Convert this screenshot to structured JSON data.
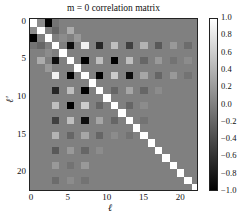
{
  "chart_data": {
    "type": "heatmap",
    "title": "m = 0 correlation matrix",
    "xlabel": "ℓ",
    "ylabel": "ℓ'",
    "size": 23,
    "x_ticks": [
      0,
      5,
      10,
      15,
      20
    ],
    "y_ticks": [
      0,
      5,
      10,
      15,
      20
    ],
    "colorbar": {
      "min": -1.0,
      "max": 1.0,
      "ticks": [
        "1.0",
        "0.8",
        "0.6",
        "0.4",
        "0.2",
        "0.0",
        "−0.2",
        "−0.4",
        "−0.6",
        "−0.8",
        "−1.0"
      ],
      "colormap": "gray"
    },
    "diagonal": 1.0,
    "offdiag_entries": [
      [
        0,
        1,
        0.1
      ],
      [
        0,
        2,
        -1.0
      ],
      [
        0,
        3,
        -0.1
      ],
      [
        1,
        3,
        -0.2
      ],
      [
        1,
        5,
        0.35
      ],
      [
        2,
        4,
        0.1
      ],
      [
        2,
        6,
        0.2
      ],
      [
        3,
        5,
        -0.9
      ],
      [
        3,
        7,
        0.9
      ],
      [
        3,
        9,
        -0.7
      ],
      [
        3,
        11,
        0.5
      ],
      [
        3,
        13,
        -0.5
      ],
      [
        3,
        15,
        0.4
      ],
      [
        3,
        17,
        -0.3
      ],
      [
        3,
        19,
        0.2
      ],
      [
        3,
        21,
        -0.15
      ],
      [
        5,
        7,
        -1.0
      ],
      [
        5,
        9,
        0.5
      ],
      [
        5,
        11,
        -1.0
      ],
      [
        5,
        13,
        0.5
      ],
      [
        5,
        15,
        -0.2
      ],
      [
        5,
        17,
        0.2
      ],
      [
        5,
        19,
        -0.1
      ],
      [
        5,
        21,
        0.1
      ],
      [
        7,
        9,
        -1.0
      ],
      [
        7,
        11,
        0.6
      ],
      [
        7,
        13,
        -0.9
      ],
      [
        7,
        15,
        0.3
      ],
      [
        7,
        17,
        -0.2
      ],
      [
        7,
        19,
        0.2
      ],
      [
        7,
        21,
        -0.1
      ],
      [
        9,
        11,
        -0.2
      ],
      [
        9,
        13,
        0.3
      ],
      [
        9,
        15,
        -0.2
      ],
      [
        9,
        17,
        0.1
      ],
      [
        11,
        13,
        -0.2
      ],
      [
        11,
        15,
        0.1
      ],
      [
        13,
        15,
        -0.1
      ]
    ]
  }
}
